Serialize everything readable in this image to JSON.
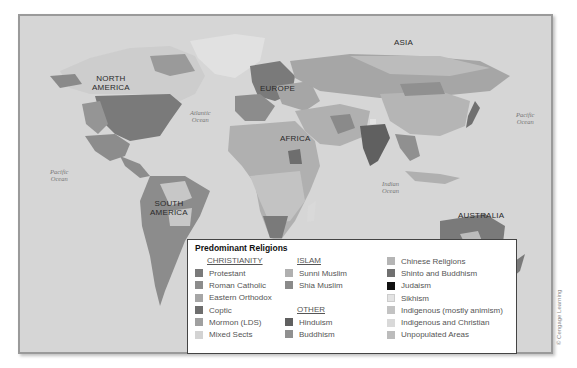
{
  "map": {
    "continent_labels": {
      "north_america": "NORTH\nAMERICA",
      "south_america": "SOUTH\nAMERICA",
      "europe": "EUROPE",
      "africa": "AFRICA",
      "asia": "ASIA",
      "australia": "AUSTRALIA"
    },
    "ocean_labels": {
      "atlantic": "Atlantic\nOcean",
      "pacific_west": "Pacific\nOcean",
      "pacific_east": "Pacific\nOcean",
      "indian": "Indian\nOcean"
    },
    "colors": {
      "water": "#d6d6d6",
      "protestant": "#7a7a7a",
      "roman_catholic": "#8c8c8c",
      "eastern_orthodox": "#a6a6a6",
      "coptic": "#6e6e6e",
      "mormon": "#a0a0a0",
      "mixed_sects": "#cfcfcf",
      "sunni": "#b0b0b0",
      "shia": "#8a8a8a",
      "hinduism": "#606060",
      "buddhism": "#909090",
      "chinese": "#b5b5b5",
      "shinto": "#707070",
      "judaism": "#111111",
      "sikhism": "#e3e3e3",
      "indigenous": "#c3c3c3",
      "indigenous_christian": "#d9d9d9",
      "unpopulated": "#bcbcbc"
    }
  },
  "legend": {
    "title": "Predominant Religions",
    "columns": [
      {
        "groups": [
          {
            "header": "CHRISTIANITY",
            "items": [
              {
                "label": "Protestant",
                "color": "#7a7a7a"
              },
              {
                "label": "Roman Catholic",
                "color": "#8c8c8c"
              },
              {
                "label": "Eastern Orthodox",
                "color": "#a6a6a6"
              },
              {
                "label": "Coptic",
                "color": "#6e6e6e"
              },
              {
                "label": "Mormon (LDS)",
                "color": "#a0a0a0"
              },
              {
                "label": "Mixed Sects",
                "color": "#d3d3d3"
              }
            ]
          }
        ]
      },
      {
        "groups": [
          {
            "header": "ISLAM",
            "items": [
              {
                "label": "Sunni Muslim",
                "color": "#b0b0b0"
              },
              {
                "label": "Shia Muslim",
                "color": "#8a8a8a"
              }
            ]
          },
          {
            "header": "OTHER",
            "items": [
              {
                "label": "Hinduism",
                "color": "#606060"
              },
              {
                "label": "Buddhism",
                "color": "#909090"
              }
            ]
          }
        ]
      },
      {
        "groups": [
          {
            "header": "",
            "items": [
              {
                "label": "Chinese Religions",
                "color": "#b5b5b5"
              },
              {
                "label": "Shinto and Buddhism",
                "color": "#707070"
              },
              {
                "label": "Judaism",
                "color": "#111111"
              },
              {
                "label": "Sikhism",
                "color": "#e3e3e3"
              },
              {
                "label": "Indigenous (mostly animism)",
                "color": "#c3c3c3"
              },
              {
                "label": "Indigenous and Christian",
                "color": "#d9d9d9"
              },
              {
                "label": "Unpopulated Areas",
                "color": "#bcbcbc"
              }
            ]
          }
        ]
      }
    ]
  },
  "credit": "© Cengage Learning"
}
